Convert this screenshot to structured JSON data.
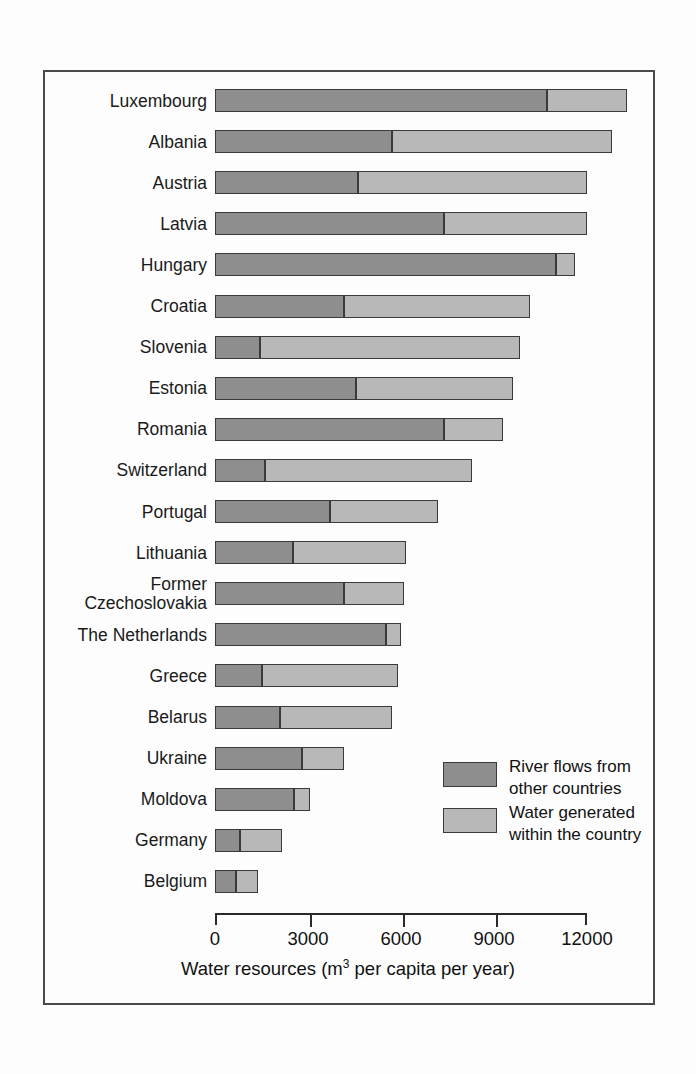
{
  "chart_data": {
    "type": "bar",
    "orientation": "horizontal",
    "stacked": true,
    "title": "",
    "xlabel": "Water resources (m3 per capita per year)",
    "xlabel_prefix": "Water resources (m",
    "xlabel_superscript": "3",
    "xlabel_suffix": " per capita per year)",
    "ylabel": "",
    "xlim": [
      0,
      12000
    ],
    "xticks": [
      0,
      3000,
      6000,
      9000,
      12000
    ],
    "xticklabels": [
      "0",
      "3000",
      "6000",
      "9000",
      "12000"
    ],
    "grid": false,
    "legend_position": "inside-lower-right",
    "categories": [
      "Luxembourg",
      "Albania",
      "Austria",
      "Latvia",
      "Hungary",
      "Croatia",
      "Slovenia",
      "Estonia",
      "Romania",
      "Switzerland",
      "Portugal",
      "Lithuania",
      "Former Czechoslovakia",
      "The Netherlands",
      "Greece",
      "Belarus",
      "Ukraine",
      "Moldova",
      "Germany",
      "Belgium"
    ],
    "category_lines": [
      [
        "Luxembourg"
      ],
      [
        "Albania"
      ],
      [
        "Austria"
      ],
      [
        "Latvia"
      ],
      [
        "Hungary"
      ],
      [
        "Croatia"
      ],
      [
        "Slovenia"
      ],
      [
        "Estonia"
      ],
      [
        "Romania"
      ],
      [
        "Switzerland"
      ],
      [
        "Portugal"
      ],
      [
        "Lithuania"
      ],
      [
        "Former",
        "Czechoslovakia"
      ],
      [
        "The Netherlands"
      ],
      [
        "Greece"
      ],
      [
        "Belarus"
      ],
      [
        "Ukraine"
      ],
      [
        "Moldova"
      ],
      [
        "Germany"
      ],
      [
        "Belgium"
      ]
    ],
    "series": [
      {
        "name": "River flows from other countries",
        "color": "#8e8e8e",
        "values": [
          10700,
          5700,
          4600,
          7400,
          11000,
          4150,
          1450,
          4550,
          7400,
          1600,
          3700,
          2500,
          4150,
          5500,
          1500,
          2100,
          2800,
          2550,
          800,
          680
        ]
      },
      {
        "name": "Water generated within the country",
        "color": "#b8b8b8",
        "values": [
          2600,
          7100,
          7400,
          4600,
          600,
          6000,
          8400,
          5050,
          1900,
          6700,
          3500,
          3650,
          1950,
          500,
          4400,
          3600,
          1350,
          500,
          1350,
          720
        ]
      }
    ],
    "totals": [
      13300,
      12800,
      12000,
      12000,
      11600,
      10150,
      9850,
      9600,
      9300,
      8300,
      7200,
      6150,
      6100,
      6000,
      5900,
      5700,
      4150,
      3050,
      2150,
      1400
    ]
  },
  "legend": {
    "entries": [
      {
        "label_line1": "River flows from",
        "label_line2": "other countries",
        "color": "#8e8e8e",
        "swatch_name": "legend-swatch-river-flows"
      },
      {
        "label_line1": "Water generated",
        "label_line2": "within the country",
        "color": "#b8b8b8",
        "swatch_name": "legend-swatch-water-generated"
      }
    ]
  }
}
